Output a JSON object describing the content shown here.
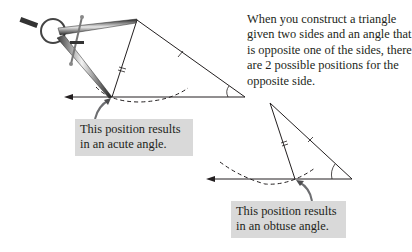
{
  "caption": {
    "text": "When you construct a triangle given two sides and an angle that is opposite one of the sides, there are 2 possible positions for the opposite side."
  },
  "callouts": {
    "acute": "This position results in an acute angle.",
    "obtuse": "This position results in an obtuse angle."
  },
  "figures": [
    {
      "name": "acute-construction",
      "apex": [
        137,
        20
      ],
      "base_point": [
        112,
        97
      ],
      "right_vertex": [
        245,
        97
      ],
      "ray_start": [
        65,
        97
      ],
      "tool": "compass"
    },
    {
      "name": "obtuse-construction",
      "apex": [
        270,
        103
      ],
      "base_point": [
        295,
        179
      ],
      "right_vertex": [
        352,
        179
      ],
      "ray_start": [
        207,
        179
      ]
    }
  ],
  "colors": {
    "line": "#231f20",
    "callout_bg": "#d9d9d9",
    "arrow_pointer": "#6d6e71"
  }
}
